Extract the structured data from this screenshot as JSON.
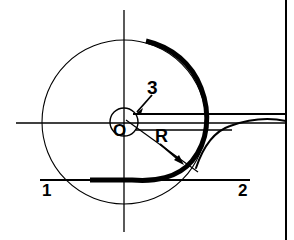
{
  "figure": {
    "width": 294,
    "height": 240,
    "background": "#ffffff",
    "ink_color": "#000000",
    "border": {
      "name": "right-border-rule",
      "x": 286,
      "y1": 0,
      "y2": 240,
      "stroke_width": 2
    }
  },
  "axes": {
    "origin": {
      "x": 124,
      "y": 123
    },
    "vertical": {
      "x": 124,
      "y1": 10,
      "y2": 232,
      "stroke_width": 1.3
    },
    "horizontal": {
      "y": 123,
      "x1": 16,
      "x2": 286,
      "stroke_width": 1.3
    }
  },
  "reference_lines": [
    {
      "name": "upper-horizontal-rule",
      "y": 114,
      "x1": 133,
      "x2": 286,
      "stroke_width": 2
    },
    {
      "name": "mid-horizontal-stub",
      "y": 130,
      "x1": 136,
      "x2": 232,
      "stroke_width": 1.6
    },
    {
      "name": "baseline-horizontal-rule",
      "y": 180,
      "x1": 40,
      "x2": 250,
      "stroke_width": 2
    }
  ],
  "circles": [
    {
      "name": "outer-circle",
      "cx": 124,
      "cy": 122,
      "r": 82,
      "stroke_width": 1.1,
      "filled": false
    },
    {
      "name": "inner-circle",
      "cx": 124,
      "cy": 122,
      "r": 14,
      "stroke_width": 1.4,
      "filled": false
    }
  ],
  "curves": [
    {
      "name": "thick-spiral-curve",
      "description": "bold Archimedean spiral arc sweeping clockwise from upper area to lower-left flat tail",
      "stroke_width": 5.0,
      "start": {
        "x": 145,
        "y": 40
      },
      "end": {
        "x": 90,
        "y": 180
      }
    },
    {
      "name": "thin-tail-curve",
      "description": "thin curve branching right from the spiral, rising then flattening toward the right border",
      "stroke_width": 2.0,
      "start": {
        "x": 196,
        "y": 165
      },
      "end": {
        "x": 286,
        "y": 121
      }
    }
  ],
  "annotations": {
    "label_3": {
      "text": "3",
      "target": "inner-circle-edge",
      "leader": {
        "from": {
          "x": 152,
          "y": 94
        },
        "to": {
          "x": 136,
          "y": 112
        }
      }
    },
    "label_O": {
      "text": "O",
      "target": "origin"
    },
    "label_R": {
      "text": "R",
      "target": "thick-spiral-curve",
      "leader": {
        "from": {
          "x": 158,
          "y": 143
        },
        "to": {
          "x": 180,
          "y": 162
        }
      }
    },
    "label_1": {
      "text": "1",
      "target": "baseline-horizontal-rule-left"
    },
    "label_2": {
      "text": "2",
      "target": "baseline-horizontal-rule-right"
    },
    "radius_leader": {
      "name": "radius-leader-line",
      "from": {
        "x": 124,
        "y": 122
      },
      "to": {
        "x": 196,
        "y": 172
      }
    }
  }
}
